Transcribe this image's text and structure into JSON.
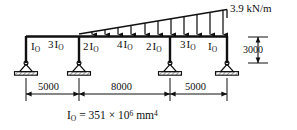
{
  "figure": {
    "type": "structural-beam-diagram",
    "background_color": "#ffffff",
    "line_color": "#101010",
    "caption": {
      "symbol": "I",
      "symbol_sub": "O",
      "equals": " = 351 × 10",
      "exponent": "6",
      "units": " mm",
      "units_exponent": "4",
      "full_text": "I_O = 351 × 10^6 mm^4"
    },
    "load": {
      "label": "3.9 kN/m",
      "shape": "triangular-distributed",
      "peak_value": 3.9,
      "peak_units": "kN/m",
      "zero_at": "support-2",
      "peak_at": "support-4",
      "arrow_count": 11
    },
    "members": [
      {
        "id": "column-left",
        "coefficient": "",
        "symbol": "I",
        "symbol_sub": "O"
      },
      {
        "id": "span-1",
        "coefficient": "3",
        "symbol": "I",
        "symbol_sub": "O"
      },
      {
        "id": "span-2-left",
        "coefficient": "2",
        "symbol": "I",
        "symbol_sub": "O"
      },
      {
        "id": "span-2-mid",
        "coefficient": "4",
        "symbol": "I",
        "symbol_sub": "O"
      },
      {
        "id": "span-2-right",
        "coefficient": "2",
        "symbol": "I",
        "symbol_sub": "O"
      },
      {
        "id": "span-3",
        "coefficient": "3",
        "symbol": "I",
        "symbol_sub": "O"
      },
      {
        "id": "column-right",
        "coefficient": "",
        "symbol": "I",
        "symbol_sub": "O"
      }
    ],
    "span_dimensions": [
      {
        "id": "span-1",
        "label": "5000"
      },
      {
        "id": "span-2",
        "label": "8000"
      },
      {
        "id": "span-3",
        "label": "5000"
      }
    ],
    "height_dimension": {
      "id": "column-height",
      "label": "3000"
    },
    "supports": [
      {
        "id": "support-1",
        "type": "pinned"
      },
      {
        "id": "support-2",
        "type": "pinned"
      },
      {
        "id": "support-3",
        "type": "pinned"
      },
      {
        "id": "support-4",
        "type": "pinned"
      }
    ]
  }
}
